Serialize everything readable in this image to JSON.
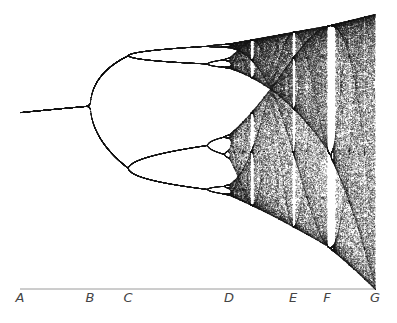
{
  "figure": {
    "type": "bifurcation-diagram",
    "axis_labels": [
      {
        "label": "A",
        "x": 20,
        "r": 2.8
      },
      {
        "label": "B",
        "x": 90,
        "r": 3.0
      },
      {
        "label": "C",
        "x": 128,
        "r": 3.449
      },
      {
        "label": "D",
        "x": 229,
        "r": 3.57
      },
      {
        "label": "E",
        "x": 293,
        "r": 3.74
      },
      {
        "label": "F",
        "x": 327,
        "r": 3.8284
      },
      {
        "label": "G",
        "x": 375,
        "r": 4.0
      }
    ],
    "colors": {
      "ink": "#1a1a1a",
      "axis": "#999999",
      "label": "#444444"
    }
  }
}
